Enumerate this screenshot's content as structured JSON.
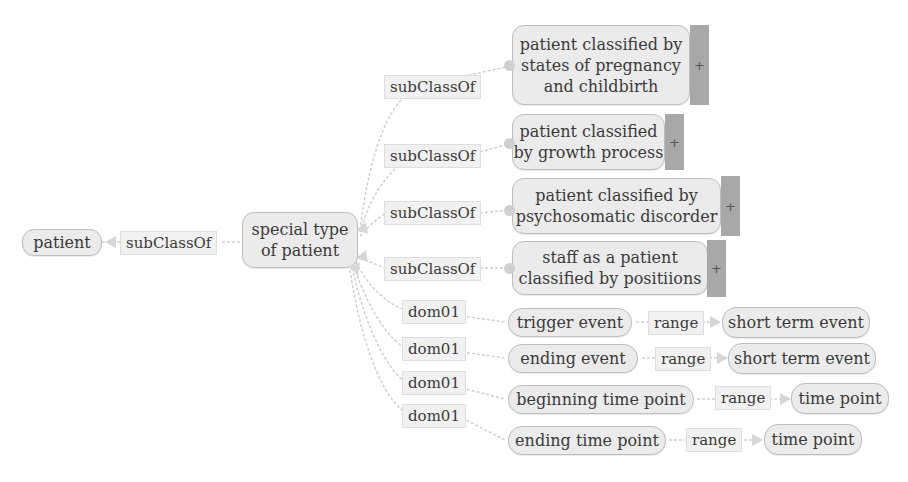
{
  "diagram": {
    "type": "ontology-graph",
    "colors": {
      "node_fill": "#ebebeb",
      "node_border": "#bdbdbd",
      "label_fill": "#f1f1f1",
      "edge": "#cccccc",
      "expander": "#a8a8a8"
    },
    "nodes": {
      "patient": "patient",
      "special_type": "special type of patient",
      "special_type_line1": "special type",
      "special_type_line2": "of patient",
      "pregnancy_line1": "patient classified by",
      "pregnancy_line2": "states of pregnancy",
      "pregnancy_line3": "and childbirth",
      "growth_line1": "patient classified",
      "growth_line2": "by growth process",
      "psycho_line1": "patient classified by",
      "psycho_line2": "psychosomatic discorder",
      "staff_line1": "staff as a patient",
      "staff_line2": "classified by positiions",
      "trigger_event": "trigger event",
      "ending_event": "ending event",
      "beginning_time_point": "beginning time point",
      "ending_time_point": "ending time point",
      "short_term_event_1": "short term event",
      "short_term_event_2": "short term event",
      "time_point_1": "time point",
      "time_point_2": "time point"
    },
    "edge_labels": {
      "subclass_root": "subClassOf",
      "subclass_1": "subClassOf",
      "subclass_2": "subClassOf",
      "subclass_3": "subClassOf",
      "subclass_4": "subClassOf",
      "dom_1": "dom01",
      "dom_2": "dom01",
      "dom_3": "dom01",
      "dom_4": "dom01",
      "range_1": "range",
      "range_2": "range",
      "range_3": "range",
      "range_4": "range"
    },
    "expander_symbol": "+",
    "edges": [
      {
        "from": "special type of patient",
        "label": "subClassOf",
        "to": "patient"
      },
      {
        "from": "patient classified by states of pregnancy and childbirth",
        "label": "subClassOf",
        "to": "special type of patient"
      },
      {
        "from": "patient classified by growth process",
        "label": "subClassOf",
        "to": "special type of patient"
      },
      {
        "from": "patient classified by psychosomatic discorder",
        "label": "subClassOf",
        "to": "special type of patient"
      },
      {
        "from": "staff as a patient classified by positiions",
        "label": "subClassOf",
        "to": "special type of patient"
      },
      {
        "from": "trigger event",
        "label": "dom01",
        "to": "special type of patient"
      },
      {
        "from": "ending event",
        "label": "dom01",
        "to": "special type of patient"
      },
      {
        "from": "beginning time point",
        "label": "dom01",
        "to": "special type of patient"
      },
      {
        "from": "ending time point",
        "label": "dom01",
        "to": "special type of patient"
      },
      {
        "from": "trigger event",
        "label": "range",
        "to": "short term event"
      },
      {
        "from": "ending event",
        "label": "range",
        "to": "short term event"
      },
      {
        "from": "beginning time point",
        "label": "range",
        "to": "time point"
      },
      {
        "from": "ending time point",
        "label": "range",
        "to": "time point"
      }
    ]
  }
}
